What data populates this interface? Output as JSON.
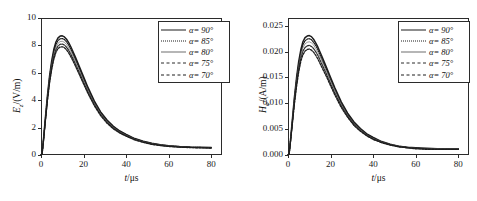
{
  "figure": {
    "background": "#ffffff",
    "panel_count": 2
  },
  "chart_data": [
    {
      "id": "left",
      "type": "line",
      "title": "",
      "xlabel": "t/μs",
      "xlabel_symbol": "t",
      "xlabel_unit": "/μs",
      "ylabel": "E_z/(V/m)",
      "ylabel_symbol": "E",
      "ylabel_sub": "z",
      "ylabel_unit": "/(V/m)",
      "xlim": [
        0,
        85
      ],
      "ylim": [
        0,
        10
      ],
      "xticks": [
        0,
        20,
        40,
        60,
        80
      ],
      "yticks": [
        0,
        2,
        4,
        6,
        8,
        10
      ],
      "xticklabels": [
        "0",
        "20",
        "40",
        "60",
        "80"
      ],
      "yticklabels": [
        "0",
        "2",
        "4",
        "6",
        "8",
        "10"
      ],
      "grid": false,
      "legend_position": "upper right",
      "x": [
        0,
        0.5,
        1,
        2,
        3,
        4,
        5,
        6,
        7,
        8,
        9,
        10,
        11,
        12,
        13,
        14,
        16,
        18,
        20,
        22,
        25,
        28,
        31,
        34,
        37,
        40,
        44,
        48,
        52,
        56,
        60,
        65,
        70,
        75,
        80
      ],
      "series": [
        {
          "name": "α= 90°",
          "alpha_deg": 90,
          "style": "solid-thick",
          "color": "#1c1c1c",
          "peak_value": 8.7,
          "peak_time": 10.5,
          "tail_value": 0.55,
          "values": [
            0,
            0.1,
            0.85,
            2.6,
            4.3,
            5.75,
            6.85,
            7.7,
            8.25,
            8.55,
            8.68,
            8.7,
            8.62,
            8.45,
            8.2,
            7.9,
            7.2,
            6.45,
            5.7,
            4.95,
            3.95,
            3.15,
            2.55,
            2.1,
            1.75,
            1.5,
            1.2,
            1.0,
            0.85,
            0.75,
            0.68,
            0.62,
            0.58,
            0.56,
            0.55
          ]
        },
        {
          "name": "α= 85°",
          "alpha_deg": 85,
          "style": "dotted",
          "color": "#1c1c1c",
          "peak_value": 8.5,
          "peak_time": 10.5,
          "tail_value": 0.54,
          "values": [
            0,
            0.1,
            0.83,
            2.55,
            4.22,
            5.62,
            6.7,
            7.52,
            8.06,
            8.36,
            8.48,
            8.5,
            8.43,
            8.26,
            8.02,
            7.73,
            7.05,
            6.32,
            5.58,
            4.85,
            3.88,
            3.09,
            2.5,
            2.06,
            1.72,
            1.47,
            1.18,
            0.98,
            0.84,
            0.74,
            0.67,
            0.61,
            0.57,
            0.55,
            0.54
          ]
        },
        {
          "name": "α= 80°",
          "alpha_deg": 80,
          "style": "solid-thin",
          "color": "#6f6f6f",
          "peak_value": 8.3,
          "peak_time": 10.5,
          "tail_value": 0.53,
          "values": [
            0,
            0.1,
            0.81,
            2.49,
            4.12,
            5.49,
            6.54,
            7.34,
            7.87,
            8.16,
            8.28,
            8.3,
            8.23,
            8.07,
            7.83,
            7.55,
            6.88,
            6.17,
            5.45,
            4.74,
            3.79,
            3.02,
            2.44,
            2.01,
            1.68,
            1.44,
            1.15,
            0.96,
            0.82,
            0.72,
            0.65,
            0.6,
            0.56,
            0.54,
            0.53
          ]
        },
        {
          "name": "α= 75°",
          "alpha_deg": 75,
          "style": "dashdot",
          "color": "#2a2a2a",
          "peak_value": 8.1,
          "peak_time": 10.5,
          "tail_value": 0.52,
          "values": [
            0,
            0.1,
            0.79,
            2.43,
            4.02,
            5.36,
            6.38,
            7.16,
            7.68,
            7.96,
            8.08,
            8.1,
            8.03,
            7.87,
            7.64,
            7.36,
            6.71,
            6.02,
            5.31,
            4.62,
            3.7,
            2.94,
            2.38,
            1.96,
            1.64,
            1.4,
            1.13,
            0.94,
            0.8,
            0.7,
            0.64,
            0.59,
            0.55,
            0.53,
            0.52
          ]
        },
        {
          "name": "α= 70°",
          "alpha_deg": 70,
          "style": "dashed",
          "color": "#1c1c1c",
          "peak_value": 7.9,
          "peak_time": 10.5,
          "tail_value": 0.51,
          "values": [
            0,
            0.1,
            0.77,
            2.37,
            3.92,
            5.23,
            6.22,
            6.98,
            7.49,
            7.77,
            7.88,
            7.9,
            7.83,
            7.68,
            7.45,
            7.18,
            6.55,
            5.87,
            5.18,
            4.51,
            3.61,
            2.87,
            2.32,
            1.91,
            1.6,
            1.37,
            1.1,
            0.92,
            0.78,
            0.69,
            0.62,
            0.57,
            0.54,
            0.52,
            0.51
          ]
        }
      ]
    },
    {
      "id": "right",
      "type": "line",
      "title": "",
      "xlabel": "t/μs",
      "xlabel_symbol": "t",
      "xlabel_unit": "/μs",
      "ylabel": "H_φ/(A/m)",
      "ylabel_symbol": "H",
      "ylabel_sub": "φ",
      "ylabel_unit": "/(A/m)",
      "xlim": [
        0,
        85
      ],
      "ylim": [
        0,
        0.0265
      ],
      "xticks": [
        0,
        20,
        40,
        60,
        80
      ],
      "yticks": [
        0.0,
        0.005,
        0.01,
        0.015,
        0.02,
        0.025
      ],
      "xticklabels": [
        "0",
        "20",
        "40",
        "60",
        "80"
      ],
      "yticklabels": [
        "0.000",
        "0.005",
        "0.010",
        "0.015",
        "0.020",
        "0.025"
      ],
      "grid": false,
      "legend_position": "upper right",
      "x": [
        0,
        0.5,
        1,
        2,
        3,
        4,
        5,
        6,
        7,
        8,
        9,
        10,
        11,
        12,
        13,
        14,
        16,
        18,
        20,
        22,
        25,
        28,
        31,
        34,
        37,
        40,
        44,
        48,
        52,
        56,
        60,
        65,
        70,
        75,
        80
      ],
      "series": [
        {
          "name": "α= 90°",
          "alpha_deg": 90,
          "style": "solid-thick",
          "color": "#1c1c1c",
          "peak_value": 0.0231,
          "peak_time": 10.5,
          "tail_value": 0.0012,
          "values": [
            0,
            0.0002,
            0.0021,
            0.0066,
            0.0111,
            0.0149,
            0.018,
            0.0203,
            0.0219,
            0.0227,
            0.023,
            0.0231,
            0.0229,
            0.0224,
            0.0217,
            0.0209,
            0.019,
            0.017,
            0.015,
            0.013,
            0.0103,
            0.0081,
            0.0064,
            0.0051,
            0.0041,
            0.0034,
            0.0026,
            0.0021,
            0.0017,
            0.0015,
            0.0014,
            0.0013,
            0.0012,
            0.0012,
            0.0012
          ]
        },
        {
          "name": "α= 85°",
          "alpha_deg": 85,
          "style": "dotted",
          "color": "#1c1c1c",
          "peak_value": 0.0225,
          "peak_time": 10.5,
          "tail_value": 0.00118,
          "values": [
            0,
            0.0002,
            0.002,
            0.0064,
            0.0108,
            0.0145,
            0.0175,
            0.0198,
            0.0213,
            0.0221,
            0.0224,
            0.0225,
            0.0223,
            0.0218,
            0.0212,
            0.0204,
            0.0185,
            0.0166,
            0.0146,
            0.0127,
            0.01,
            0.0079,
            0.0062,
            0.005,
            0.004,
            0.0033,
            0.0025,
            0.002,
            0.0017,
            0.0015,
            0.0013,
            0.0012,
            0.0012,
            0.0012,
            0.0012
          ]
        },
        {
          "name": "α= 80°",
          "alpha_deg": 80,
          "style": "solid-thin",
          "color": "#6f6f6f",
          "peak_value": 0.0219,
          "peak_time": 10.5,
          "tail_value": 0.00116,
          "values": [
            0,
            0.0002,
            0.002,
            0.0062,
            0.0105,
            0.0141,
            0.0171,
            0.0193,
            0.0207,
            0.0215,
            0.0218,
            0.0219,
            0.0217,
            0.0213,
            0.0206,
            0.0199,
            0.0181,
            0.0162,
            0.0143,
            0.0124,
            0.0098,
            0.0077,
            0.0061,
            0.0049,
            0.0039,
            0.0032,
            0.0025,
            0.002,
            0.0017,
            0.0014,
            0.0013,
            0.0012,
            0.0012,
            0.0012,
            0.0012
          ]
        },
        {
          "name": "α= 75°",
          "alpha_deg": 75,
          "style": "dashdot",
          "color": "#2a2a2a",
          "peak_value": 0.0212,
          "peak_time": 10.5,
          "tail_value": 0.00114,
          "values": [
            0,
            0.0002,
            0.0019,
            0.006,
            0.0102,
            0.0137,
            0.0165,
            0.0187,
            0.0201,
            0.0208,
            0.0211,
            0.0212,
            0.021,
            0.0206,
            0.02,
            0.0193,
            0.0175,
            0.0157,
            0.0138,
            0.012,
            0.0095,
            0.0075,
            0.0059,
            0.0047,
            0.0038,
            0.0031,
            0.0024,
            0.002,
            0.0016,
            0.0014,
            0.0013,
            0.0012,
            0.0011,
            0.0011,
            0.0011
          ]
        },
        {
          "name": "α= 70°",
          "alpha_deg": 70,
          "style": "dashed",
          "color": "#1c1c1c",
          "peak_value": 0.0205,
          "peak_time": 10.5,
          "tail_value": 0.00112,
          "values": [
            0,
            0.0002,
            0.0019,
            0.0058,
            0.0098,
            0.0132,
            0.016,
            0.0181,
            0.0194,
            0.0201,
            0.0204,
            0.0205,
            0.0203,
            0.0199,
            0.0193,
            0.0186,
            0.0169,
            0.0152,
            0.0134,
            0.0116,
            0.0092,
            0.0073,
            0.0057,
            0.0046,
            0.0037,
            0.003,
            0.0024,
            0.0019,
            0.0016,
            0.0014,
            0.0012,
            0.0011,
            0.0011,
            0.0011,
            0.0011
          ]
        }
      ]
    }
  ]
}
